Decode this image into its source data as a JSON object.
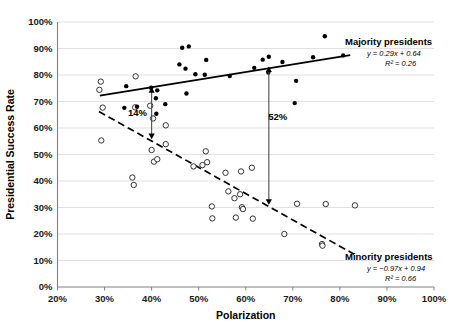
{
  "chart_data": {
    "type": "scatter",
    "title": "",
    "xlabel": "Polarization",
    "ylabel": "Presidential Success Rate",
    "xlim": [
      20,
      100
    ],
    "ylim": [
      0,
      100
    ],
    "xticks": [
      "20%",
      "30%",
      "40%",
      "50%",
      "60%",
      "70%",
      "80%",
      "90%",
      "100%"
    ],
    "xtick_values": [
      20,
      30,
      40,
      50,
      60,
      70,
      80,
      90,
      100
    ],
    "yticks": [
      "0%",
      "10%",
      "20%",
      "30%",
      "40%",
      "50%",
      "60%",
      "70%",
      "80%",
      "90%",
      "100%"
    ],
    "ytick_values": [
      0,
      10,
      20,
      30,
      40,
      50,
      60,
      70,
      80,
      90,
      100
    ],
    "grid": "horizontal",
    "legend_position": "inside-right",
    "series": [
      {
        "name": "Majority presidents",
        "marker": "filled-circle",
        "equation": "y = 0.29x + 0.64",
        "r_squared": "R² = 0.26",
        "slope": 0.29,
        "intercept": 0.64,
        "points": [
          [
            34.6,
            75.8
          ],
          [
            34.2,
            67.6
          ],
          [
            36.9,
            68.0
          ],
          [
            39.9,
            75.2
          ],
          [
            41.2,
            74.2
          ],
          [
            40.9,
            71.2
          ],
          [
            41.0,
            65.4
          ],
          [
            42.9,
            69.0
          ],
          [
            45.9,
            84.0
          ],
          [
            46.5,
            90.3
          ],
          [
            47.9,
            90.8
          ],
          [
            47.2,
            82.4
          ],
          [
            47.4,
            73.0
          ],
          [
            49.3,
            80.3
          ],
          [
            51.6,
            85.7
          ],
          [
            51.3,
            80.1
          ],
          [
            56.6,
            79.6
          ],
          [
            61.8,
            82.7
          ],
          [
            63.6,
            85.8
          ],
          [
            64.9,
            86.9
          ],
          [
            64.8,
            80.9
          ],
          [
            67.8,
            84.9
          ],
          [
            70.7,
            77.8
          ],
          [
            70.4,
            69.4
          ],
          [
            74.3,
            86.7
          ],
          [
            76.8,
            94.6
          ],
          [
            80.7,
            87.4
          ]
        ]
      },
      {
        "name": "Minority presidents",
        "marker": "open-circle",
        "equation": "y = −0.97x + 0.94",
        "r_squared": "R² = 0.66",
        "slope": -0.97,
        "intercept": 0.94,
        "points": [
          [
            29.2,
            77.5
          ],
          [
            28.9,
            74.4
          ],
          [
            29.6,
            67.7
          ],
          [
            29.3,
            55.3
          ],
          [
            35.9,
            41.3
          ],
          [
            36.2,
            38.5
          ],
          [
            36.6,
            79.5
          ],
          [
            36.5,
            67.8
          ],
          [
            39.7,
            68.4
          ],
          [
            40.3,
            63.6
          ],
          [
            40.0,
            51.7
          ],
          [
            40.5,
            47.3
          ],
          [
            41.2,
            48.2
          ],
          [
            43.0,
            61.0
          ],
          [
            43.0,
            53.9
          ],
          [
            48.9,
            45.5
          ],
          [
            50.8,
            46.0
          ],
          [
            51.5,
            51.2
          ],
          [
            51.8,
            47.1
          ],
          [
            52.8,
            30.4
          ],
          [
            52.9,
            25.9
          ],
          [
            55.7,
            43.1
          ],
          [
            56.3,
            36.1
          ],
          [
            57.6,
            33.5
          ],
          [
            57.9,
            26.2
          ],
          [
            58.8,
            35.0
          ],
          [
            59.0,
            43.6
          ],
          [
            59.2,
            30.1
          ],
          [
            59.4,
            29.4
          ],
          [
            61.3,
            45.0
          ],
          [
            61.5,
            25.8
          ],
          [
            68.2,
            20.0
          ],
          [
            70.9,
            31.4
          ],
          [
            76.2,
            16.2
          ],
          [
            76.3,
            15.6
          ],
          [
            77.0,
            31.3
          ],
          [
            83.2,
            30.8
          ]
        ]
      }
    ],
    "trendlines": [
      {
        "name": "majority-trend",
        "style": "solid",
        "x1": 29.0,
        "y1": 72.2,
        "x2": 82.2,
        "y2": 87.5
      },
      {
        "name": "minority-trend",
        "style": "dashed",
        "x1": 28.8,
        "y1": 66.2,
        "x2": 83.0,
        "y2": 12.4
      }
    ],
    "annotations": [
      {
        "name": "gap-14",
        "label": "14%",
        "x": 40.0,
        "y_top": 75.4,
        "y_bottom": 55.8,
        "label_x": 37.0,
        "label_y": 64.5
      },
      {
        "name": "gap-52",
        "label": "52%",
        "x": 64.9,
        "y_top": 83.2,
        "y_bottom": 31.0,
        "label_x": 66.8,
        "label_y": 63.0
      }
    ]
  }
}
